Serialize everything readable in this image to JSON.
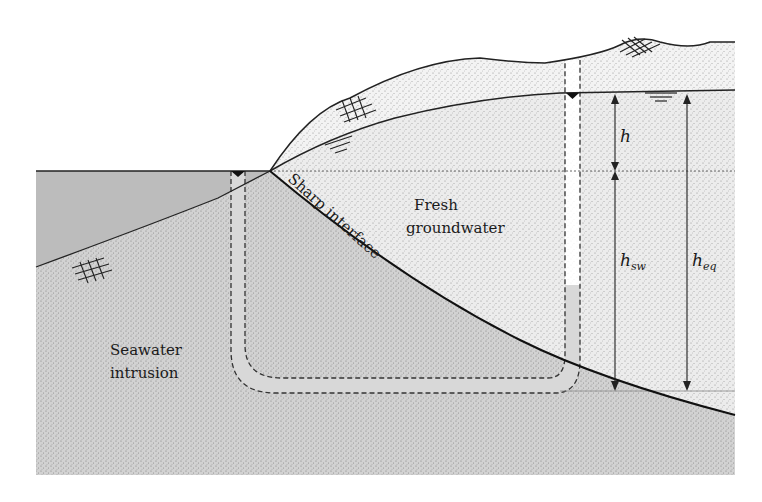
{
  "diagram": {
    "type": "cross-section",
    "labels": {
      "fresh_line1": "Fresh",
      "fresh_line2": "groundwater",
      "seawater_line1": "Seawater",
      "seawater_line2": "intrusion",
      "interface": "Sharp interface",
      "h": "h",
      "h_sw_base": "h",
      "h_sw_sub": "sw",
      "h_eq_base": "h",
      "h_eq_sub": "eq"
    },
    "regions": [
      {
        "name": "sea",
        "color": "#b9b9b9"
      },
      {
        "name": "unsaturated-zone",
        "color": "#efefef"
      },
      {
        "name": "fresh-groundwater",
        "color": "#e9e9e9"
      },
      {
        "name": "saltwater-wedge",
        "color": "#cfcfcf"
      },
      {
        "name": "background",
        "color": "#ffffff"
      }
    ],
    "symbols": [
      {
        "name": "water-table-symbol",
        "count": 3
      },
      {
        "name": "sea-level-symbol",
        "count": 1
      },
      {
        "name": "bedrock-hatch-symbol",
        "count": 3
      }
    ],
    "dimensions": [
      {
        "name": "h",
        "from": "water table",
        "to": "sea level"
      },
      {
        "name": "h_sw",
        "from": "sea level",
        "to": "interface depth"
      },
      {
        "name": "h_eq",
        "from": "water table",
        "to": "interface depth"
      }
    ]
  }
}
